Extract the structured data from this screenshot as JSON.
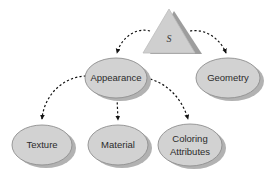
{
  "diagram": {
    "type": "tree",
    "background_color": "#ffffff",
    "shape_fill": "#d2d2d2",
    "shape_stroke": "#8a8a8a",
    "shadow_color": "#b0b0b0",
    "triangle_fill": "#cfcfcf",
    "triangle_shadow": "#9d9d9d",
    "edge_color": "#1a1a1a",
    "edge_style": "dashed",
    "nodes": [
      {
        "id": "root",
        "label": "S",
        "shape": "triangle",
        "cx": 169,
        "cy": 36,
        "width": 58,
        "height": 45
      },
      {
        "id": "appearance",
        "label": "Appearance",
        "shape": "ellipse",
        "cx": 116,
        "cy": 78,
        "rx": 31,
        "ry": 20
      },
      {
        "id": "geometry",
        "label": "Geometry",
        "shape": "ellipse",
        "cx": 228,
        "cy": 78,
        "rx": 32,
        "ry": 20
      },
      {
        "id": "texture",
        "label": "Texture",
        "shape": "ellipse",
        "cx": 42,
        "cy": 145,
        "rx": 30,
        "ry": 20
      },
      {
        "id": "material",
        "label": "Material",
        "shape": "ellipse",
        "cx": 118,
        "cy": 145,
        "rx": 30,
        "ry": 20
      },
      {
        "id": "coloring_attributes",
        "label": "Coloring Attributes",
        "label_lines": [
          "Coloring",
          "Attributes"
        ],
        "shape": "ellipse",
        "cx": 190,
        "cy": 145,
        "rx": 32,
        "ry": 21
      }
    ],
    "edges": [
      {
        "id": "root-appearance",
        "from": "root",
        "to": "appearance",
        "style": "dashed",
        "arrow": true
      },
      {
        "id": "root-geometry",
        "from": "root",
        "to": "geometry",
        "style": "dashed",
        "arrow": true
      },
      {
        "id": "appearance-texture",
        "from": "appearance",
        "to": "texture",
        "style": "dashed",
        "arrow": true
      },
      {
        "id": "appearance-material",
        "from": "appearance",
        "to": "material",
        "style": "dashed",
        "arrow": true
      },
      {
        "id": "appearance-coloring",
        "from": "appearance",
        "to": "coloring_attributes",
        "style": "dashed",
        "arrow": true
      }
    ]
  }
}
